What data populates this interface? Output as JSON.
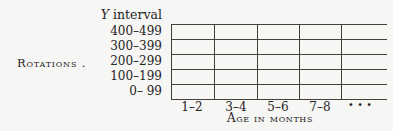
{
  "figure": {
    "background_color": "#f6f6f4",
    "line_color": "#45423c",
    "text_color": "#26231e"
  },
  "chart_data": {
    "type": "table",
    "title": "",
    "y_axis_title": "Y interval",
    "y_axis_title_var": "Y",
    "y_axis_title_rest": " interval",
    "ylabel": "Rotations .",
    "xlabel": "Age in months",
    "y_categories": [
      "400–499",
      "300–399",
      "200–299",
      "100–199",
      "0– 99"
    ],
    "x_categories": [
      "1–2",
      "3–4",
      "5–6",
      "7–8"
    ],
    "x_continuation": "...",
    "values": [],
    "grid": true,
    "grid_rows": 5,
    "grid_columns": 5,
    "legend": false
  }
}
